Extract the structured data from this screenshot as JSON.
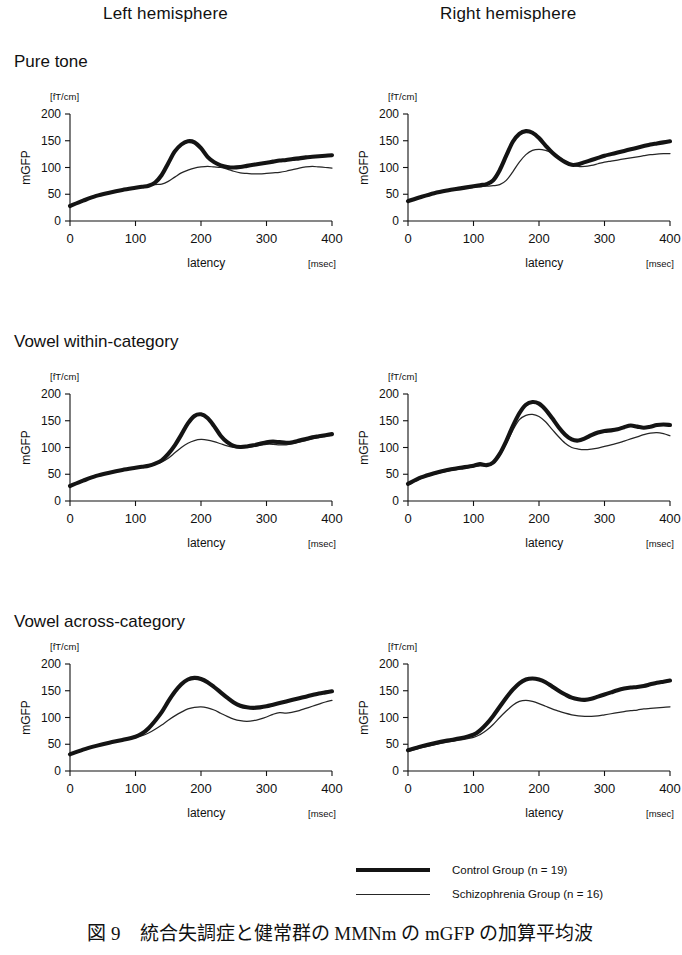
{
  "columns": [
    {
      "label": "Left hemisphere"
    },
    {
      "label": "Right hemisphere"
    }
  ],
  "rows": [
    {
      "label": "Pure tone"
    },
    {
      "label": "Vowel within-category"
    },
    {
      "label": "Vowel across-category"
    }
  ],
  "axes": {
    "unit_y": "[fT/cm]",
    "unit_x": "[msec]",
    "ylabel": "mGFP",
    "xlabel": "latency",
    "yticks": [
      "200",
      "150",
      "100",
      "50",
      "0"
    ],
    "xticks": [
      "0",
      "100",
      "200",
      "300",
      "400"
    ]
  },
  "legend": {
    "items": [
      {
        "label": "Control Group (n = 19)",
        "style": "thick",
        "color": "#141414"
      },
      {
        "label": "Schizophrenia Group (n = 16)",
        "style": "thin",
        "color": "#262626"
      }
    ]
  },
  "caption": "図 9　統合失調症と健常群の MMNm の mGFP の加算平均波",
  "chart_data": {
    "type": "line",
    "title": "図 9　統合失調症と健常群の MMNm の mGFP の加算平均波",
    "xlabel": "latency",
    "ylabel": "mGFP",
    "xunit": "[msec]",
    "yunit": "[fT/cm]",
    "xlim": [
      0,
      400
    ],
    "ylim": [
      0,
      200
    ],
    "xticks": [
      0,
      100,
      200,
      300,
      400
    ],
    "yticks": [
      0,
      50,
      100,
      150,
      200
    ],
    "grid": false,
    "legend_position": "bottom-right",
    "x": [
      0,
      20,
      40,
      60,
      80,
      100,
      110,
      120,
      130,
      140,
      150,
      160,
      170,
      180,
      190,
      200,
      210,
      220,
      230,
      240,
      250,
      260,
      270,
      280,
      290,
      300,
      310,
      320,
      330,
      340,
      350,
      360,
      370,
      380,
      390,
      400
    ],
    "panels": [
      {
        "condition": "Pure tone",
        "hemisphere": "Left hemisphere",
        "series": [
          {
            "name": "Control Group (n = 19)",
            "values": [
              28,
              38,
              47,
              53,
              58,
              62,
              64,
              66,
              72,
              86,
              108,
              130,
              143,
              149,
              147,
              136,
              120,
              110,
              104,
              101,
              100,
              101,
              103,
              105,
              107,
              109,
              111,
              113,
              114,
              116,
              117,
              119,
              120,
              121,
              122,
              123
            ]
          },
          {
            "name": "Schizophrenia Group (n = 16)",
            "values": [
              28,
              38,
              47,
              53,
              58,
              62,
              64,
              66,
              68,
              69,
              74,
              82,
              90,
              95,
              99,
              101,
              102,
              101,
              100,
              97,
              93,
              90,
              89,
              88,
              88,
              89,
              90,
              91,
              93,
              96,
              99,
              101,
              102,
              101,
              100,
              99
            ]
          }
        ]
      },
      {
        "condition": "Pure tone",
        "hemisphere": "Right hemisphere",
        "series": [
          {
            "name": "Control Group (n = 19)",
            "values": [
              37,
              45,
              52,
              57,
              61,
              65,
              67,
              69,
              76,
              95,
              122,
              148,
              163,
              168,
              165,
              155,
              141,
              128,
              118,
              110,
              105,
              106,
              110,
              114,
              118,
              122,
              125,
              128,
              131,
              134,
              137,
              140,
              143,
              145,
              147,
              149
            ]
          },
          {
            "name": "Schizophrenia Group (n = 16)",
            "values": [
              37,
              45,
              52,
              57,
              60,
              63,
              64,
              65,
              66,
              68,
              76,
              92,
              110,
              124,
              132,
              134,
              132,
              127,
              120,
              112,
              105,
              102,
              102,
              104,
              107,
              110,
              112,
              114,
              116,
              118,
              120,
              122,
              124,
              125,
              126,
              126
            ]
          }
        ]
      },
      {
        "condition": "Vowel within-category",
        "hemisphere": "Left hemisphere",
        "series": [
          {
            "name": "Control Group (n = 19)",
            "values": [
              28,
              38,
              47,
              53,
              58,
              62,
              64,
              66,
              70,
              76,
              88,
              104,
              124,
              145,
              159,
              162,
              155,
              140,
              122,
              110,
              103,
              101,
              102,
              104,
              107,
              110,
              111,
              110,
              109,
              110,
              113,
              116,
              119,
              121,
              123,
              125
            ]
          },
          {
            "name": "Schizophrenia Group (n = 16)",
            "values": [
              28,
              38,
              47,
              53,
              58,
              62,
              64,
              66,
              69,
              73,
              80,
              90,
              100,
              108,
              113,
              115,
              114,
              111,
              107,
              103,
              100,
              99,
              100,
              102,
              104,
              106,
              106,
              105,
              105,
              107,
              110,
              113,
              116,
              119,
              121,
              123
            ]
          }
        ]
      },
      {
        "condition": "Vowel within-category",
        "hemisphere": "Right hemisphere",
        "series": [
          {
            "name": "Control Group (n = 19)",
            "values": [
              32,
              44,
              52,
              58,
              62,
              66,
              69,
              67,
              72,
              88,
              112,
              140,
              164,
              180,
              185,
              182,
              171,
              155,
              138,
              124,
              115,
              113,
              117,
              123,
              128,
              131,
              132,
              134,
              138,
              141,
              139,
              137,
              139,
              142,
              143,
              142
            ]
          },
          {
            "name": "Schizophrenia Group (n = 16)",
            "values": [
              30,
              42,
              50,
              56,
              60,
              64,
              66,
              65,
              70,
              85,
              107,
              132,
              152,
              160,
              162,
              158,
              148,
              134,
              120,
              108,
              100,
              97,
              96,
              97,
              99,
              102,
              105,
              108,
              112,
              116,
              120,
              124,
              127,
              128,
              126,
              122
            ]
          }
        ]
      },
      {
        "condition": "Vowel across-category",
        "hemisphere": "Left hemisphere",
        "series": [
          {
            "name": "Control Group (n = 19)",
            "values": [
              31,
              40,
              47,
              53,
              58,
              64,
              70,
              80,
              94,
              110,
              130,
              148,
              162,
              171,
              174,
              172,
              166,
              157,
              147,
              137,
              128,
              122,
              119,
              118,
              119,
              121,
              124,
              127,
              130,
              133,
              136,
              139,
              142,
              145,
              147,
              149
            ]
          },
          {
            "name": "Schizophrenia Group (n = 16)",
            "values": [
              31,
              40,
              47,
              53,
              58,
              63,
              66,
              71,
              78,
              86,
              95,
              103,
              110,
              116,
              119,
              120,
              118,
              114,
              108,
              102,
              97,
              94,
              93,
              94,
              97,
              101,
              106,
              109,
              108,
              110,
              113,
              117,
              121,
              125,
              129,
              132
            ]
          }
        ]
      },
      {
        "condition": "Vowel across-category",
        "hemisphere": "Right hemisphere",
        "series": [
          {
            "name": "Control Group (n = 19)",
            "values": [
              39,
              46,
              52,
              57,
              61,
              68,
              76,
              88,
              103,
              120,
              137,
              152,
              164,
              171,
              173,
              171,
              166,
              158,
              150,
              143,
              137,
              134,
              133,
              135,
              139,
              143,
              147,
              151,
              154,
              156,
              157,
              159,
              162,
              165,
              167,
              169
            ]
          },
          {
            "name": "Schizophrenia Group (n = 16)",
            "values": [
              36,
              43,
              49,
              54,
              58,
              63,
              68,
              76,
              87,
              100,
              112,
              123,
              130,
              132,
              130,
              126,
              121,
              116,
              112,
              108,
              105,
              103,
              102,
              102,
              103,
              105,
              107,
              109,
              111,
              113,
              114,
              116,
              117,
              118,
              119,
              120
            ]
          }
        ]
      }
    ]
  }
}
